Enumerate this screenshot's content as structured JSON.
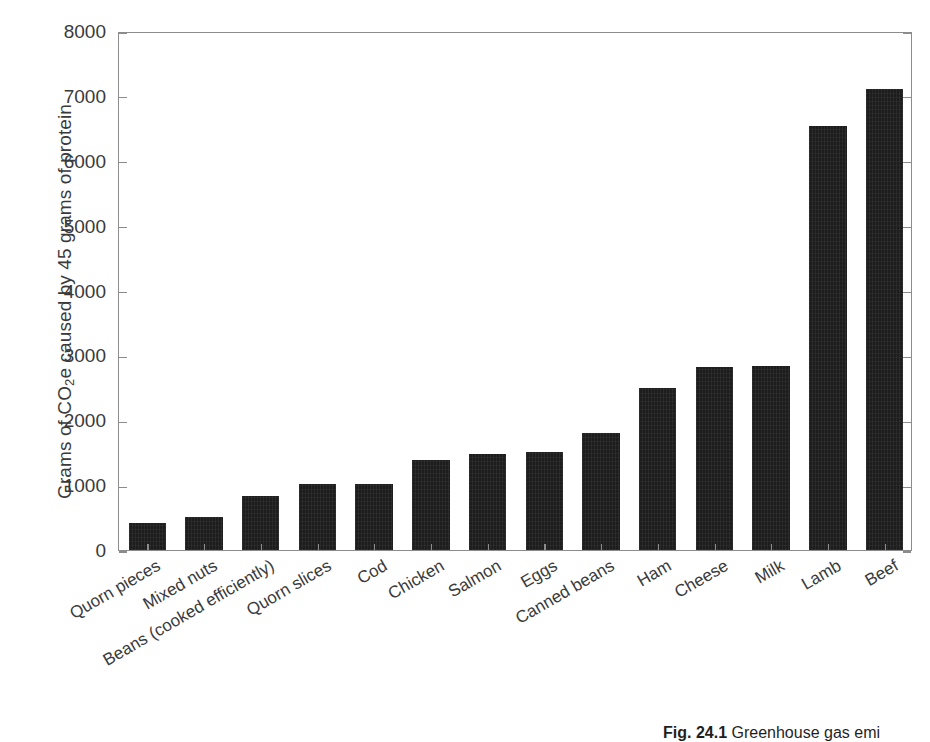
{
  "figure": {
    "caption_prefix": "Fig. 24.1",
    "caption_text": "Greenhouse gas emi",
    "bar_color": "#1d1d1d",
    "axis_color": "#8c8c8c",
    "text_color": "#3a3a3a"
  },
  "axes": {
    "y_title_part1": "Grams of CO",
    "y_title_sub": "2",
    "y_title_part2": "e caused by 45 grams of protein",
    "y_ticks": [
      "0",
      "1000",
      "2000",
      "3000",
      "4000",
      "5000",
      "6000",
      "7000",
      "8000"
    ]
  },
  "chart_data": {
    "type": "bar",
    "title": "",
    "xlabel": "",
    "ylabel": "Grams of CO2e caused by 45 grams of protein",
    "ylim": [
      0,
      8000
    ],
    "ytick_values": [
      0,
      1000,
      2000,
      3000,
      4000,
      5000,
      6000,
      7000,
      8000
    ],
    "grid": false,
    "legend": false,
    "categories": [
      "Quorn pieces",
      "Mixed nuts",
      "Beans (cooked efficiently)",
      "Quorn slices",
      "Cod",
      "Chicken",
      "Salmon",
      "Eggs",
      "Canned beans",
      "Ham",
      "Cheese",
      "Milk",
      "Lamb",
      "Beef"
    ],
    "values": [
      415,
      510,
      835,
      1010,
      1010,
      1390,
      1480,
      1510,
      1800,
      2490,
      2820,
      2840,
      6530,
      7100
    ]
  }
}
